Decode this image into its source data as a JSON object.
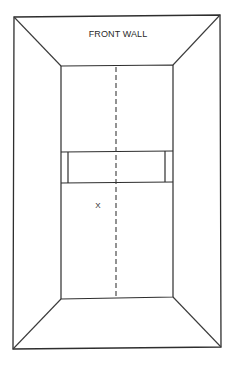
{
  "diagram": {
    "title": "FRONT WALL",
    "marker": "X",
    "colors": {
      "line": "#2e2e2e",
      "text": "#2a2a2a",
      "background": "#ffffff"
    },
    "geometry": {
      "outer": {
        "tl": [
          14,
          17
        ],
        "tr": [
          220,
          15
        ],
        "br": [
          221,
          347
        ],
        "bl": [
          13,
          349
        ]
      },
      "inner": {
        "tl": [
          61,
          66
        ],
        "tr": [
          173,
          65
        ],
        "br": [
          173,
          297
        ],
        "bl": [
          61,
          299
        ]
      },
      "service_band": {
        "top_y": 152,
        "bottom_y": 183,
        "left_x": 68,
        "right_x": 165
      },
      "center_line_x": 116,
      "marker_position": [
        98,
        205
      ],
      "title_position": [
        118,
        37
      ]
    }
  }
}
